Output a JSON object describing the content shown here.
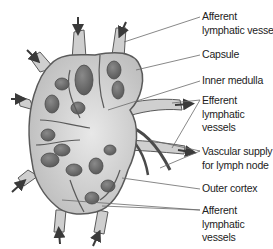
{
  "diagram": {
    "colors": {
      "tissue_fill": "#cfcfcf",
      "tissue_outline": "#5a5a5a",
      "nodule_fill": "#6f6f6f",
      "vessel_dark": "#4a4a4a",
      "arrow": "#3a3a3a",
      "leader_line": "#6a6a6a",
      "text": "#222222"
    },
    "labels": [
      {
        "id": "afferent-top",
        "lines": [
          "Afferent",
          "lymphatic vessel"
        ]
      },
      {
        "id": "capsule",
        "lines": [
          "Capsule"
        ]
      },
      {
        "id": "inner-medulla",
        "lines": [
          "Inner medulla"
        ]
      },
      {
        "id": "efferent",
        "lines": [
          "Efferent",
          "lymphatic",
          "vessels"
        ]
      },
      {
        "id": "vascular-supply",
        "lines": [
          "Vascular supply",
          "for lymph node"
        ]
      },
      {
        "id": "outer-cortex",
        "lines": [
          "Outer cortex"
        ]
      },
      {
        "id": "afferent-bottom",
        "lines": [
          "Afferent",
          "lymphatic",
          "vessels"
        ]
      }
    ]
  }
}
